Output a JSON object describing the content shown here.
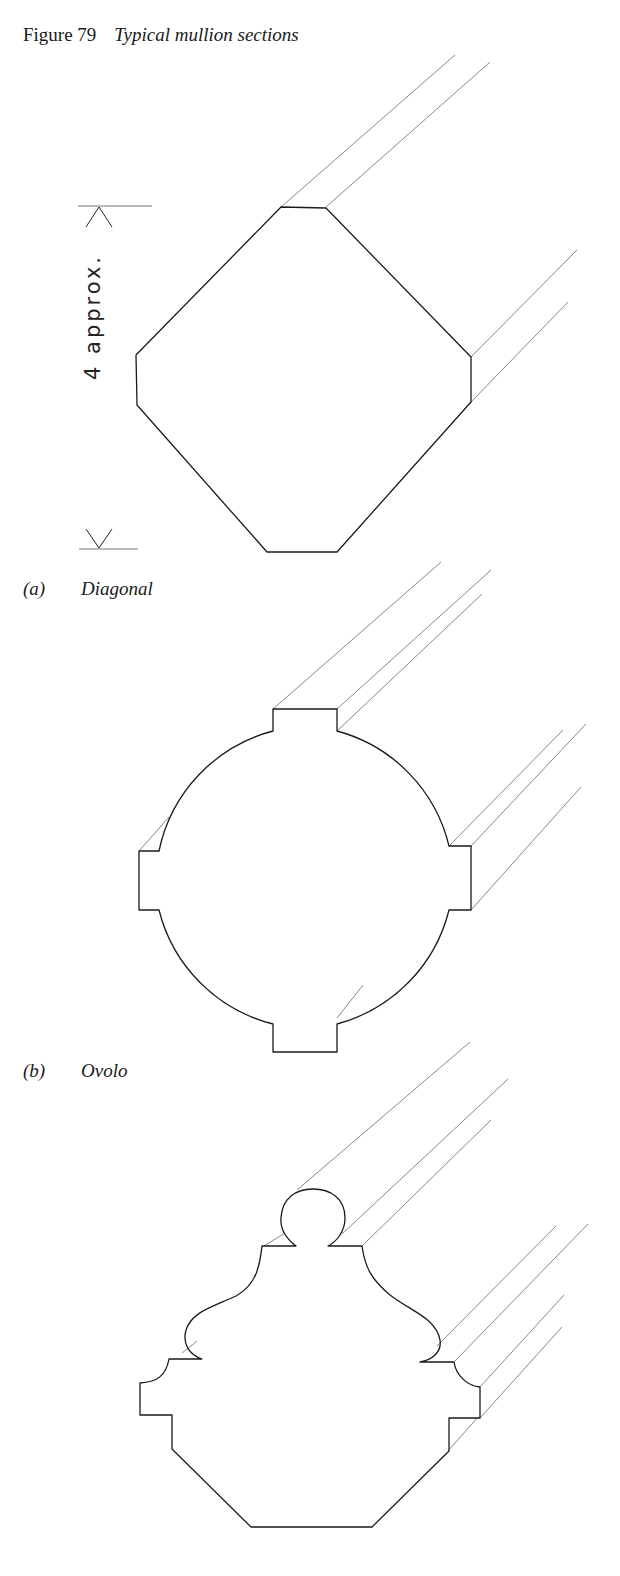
{
  "figure": {
    "number": "Figure 79",
    "title": "Typical mullion sections"
  },
  "dimension": {
    "label": "4 approx."
  },
  "sections": [
    {
      "tag": "(a)",
      "name": "Diagonal"
    },
    {
      "tag": "(b)",
      "name": "Ovolo"
    },
    {
      "tag": "(c)",
      "name": ""
    }
  ],
  "colors": {
    "outline": "#1a1a1a",
    "projection": "#7a7a7a",
    "background": "#ffffff"
  }
}
